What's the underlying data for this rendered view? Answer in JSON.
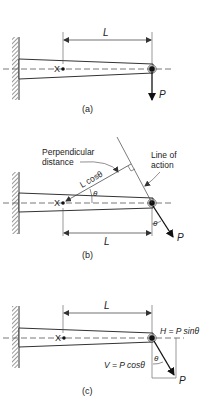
{
  "figure": {
    "panels": [
      {
        "id": "a",
        "caption": "(a)",
        "dimension_label": "L",
        "point_label": "X",
        "force_label": "P"
      },
      {
        "id": "b",
        "caption": "(b)",
        "dimension_label": "L",
        "point_label": "X",
        "force_label": "P",
        "perpendicular_label_line1": "Perpendicular",
        "perpendicular_label_line2": "distance",
        "lever_label": "L cosθ",
        "line_of_action_line1": "Line of",
        "line_of_action_line2": "action",
        "angle_label": "θ",
        "angle_label_force": "θ"
      },
      {
        "id": "c",
        "caption": "(c)",
        "dimension_label": "L",
        "point_label": "X",
        "force_label": "P",
        "horizontal_component": "H = P sinθ",
        "vertical_component": "V = P cosθ",
        "angle_label": "θ"
      }
    ]
  }
}
